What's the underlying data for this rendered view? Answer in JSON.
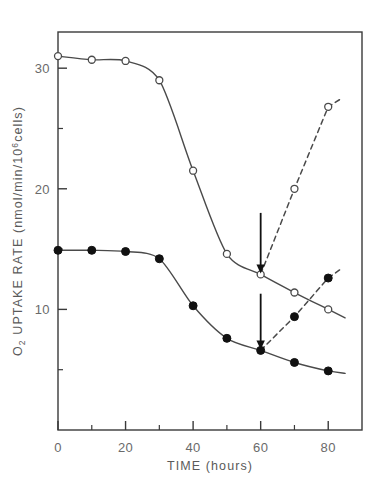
{
  "figure": {
    "background": "#ffffff",
    "frame_color": "#3a3a3a",
    "curve_color": "#4a4a4a",
    "marker_open_fill": "#ffffff",
    "marker_closed_fill": "#111111",
    "arrow_color": "#111111"
  },
  "axes": {
    "x": {
      "label_main": "TIME",
      "label_unit": "(hours)",
      "label_full": "TIME (hours)",
      "min": 0,
      "max": 90,
      "major_ticks": [
        0,
        20,
        40,
        60,
        80
      ],
      "minor_ticks": [
        10,
        30,
        50,
        70
      ],
      "tick_labels": [
        "0",
        "20",
        "40",
        "60",
        "80"
      ]
    },
    "y": {
      "label_prefix": "O",
      "label_sub": "2",
      "label_mid": " UPTAKE RATE (nmol/min/10",
      "label_sup": "6",
      "label_suffix": "cells)",
      "label_full": "O2 UPTAKE RATE (nmol/min/10^6 cells)",
      "min": 0,
      "max": 33,
      "major_ticks": [
        10,
        20,
        30
      ],
      "minor_ticks": [
        5,
        15,
        25
      ],
      "tick_labels": [
        "10",
        "20",
        "30"
      ]
    }
  },
  "annotations": [
    {
      "name": "arrow-upper",
      "target_x": 60,
      "target_y": 12.9,
      "tail_y": 18.0,
      "label": ""
    },
    {
      "name": "arrow-lower",
      "target_x": 60,
      "target_y": 6.6,
      "tail_y": 11.3,
      "label": ""
    }
  ],
  "chart_data": {
    "type": "line",
    "title": "",
    "xlabel": "TIME (hours)",
    "ylabel": "O2 UPTAKE RATE (nmol/min/10^6 cells)",
    "xlim": [
      0,
      90
    ],
    "ylim": [
      0,
      33
    ],
    "grid": false,
    "legend": "none",
    "series": [
      {
        "name": "open-circle-control",
        "marker": "open-circle",
        "linestyle": "solid",
        "x": [
          0,
          10,
          20,
          30,
          40,
          50,
          60,
          70,
          80,
          85
        ],
        "values": [
          31.0,
          30.7,
          30.6,
          29.0,
          21.5,
          14.6,
          12.9,
          11.4,
          10.0,
          9.3
        ]
      },
      {
        "name": "open-circle-recovery",
        "marker": "open-circle",
        "linestyle": "dashed",
        "x": [
          60,
          70,
          80,
          84
        ],
        "values": [
          12.9,
          20.0,
          26.8,
          27.5
        ]
      },
      {
        "name": "filled-circle-control",
        "marker": "filled-circle",
        "linestyle": "solid",
        "x": [
          0,
          10,
          20,
          30,
          40,
          50,
          60,
          70,
          80,
          85
        ],
        "values": [
          14.9,
          14.9,
          14.8,
          14.2,
          10.3,
          7.6,
          6.6,
          5.6,
          4.9,
          4.7
        ]
      },
      {
        "name": "filled-circle-recovery",
        "marker": "filled-circle",
        "linestyle": "dashed",
        "x": [
          60,
          70,
          80,
          84
        ],
        "values": [
          6.6,
          9.4,
          12.6,
          13.4
        ]
      }
    ]
  }
}
